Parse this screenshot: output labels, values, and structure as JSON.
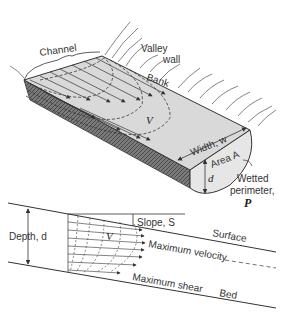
{
  "top_diagram": {
    "labels": {
      "channel": "Channel",
      "valley": "Valley",
      "wall": "wall",
      "bank": "Bank",
      "velocity": "V",
      "width": "Width, w",
      "area": "Area A",
      "depth": "d",
      "wetted": "Wetted",
      "perimeter": "perimeter,",
      "perimeter_symbol": "P"
    }
  },
  "bottom_diagram": {
    "labels": {
      "depth": "Depth, d",
      "slope": "Slope, S",
      "surface": "Surface",
      "velocity": "V",
      "max_velocity": "Maximum velocity",
      "max_shear": "Maximum shear",
      "bed": "Bed"
    }
  },
  "colors": {
    "line": "#333333",
    "water_fill": "#d9d9d9",
    "bank_fill": "#8a8a8a",
    "cross_section_fill": "#e6e6e6"
  }
}
